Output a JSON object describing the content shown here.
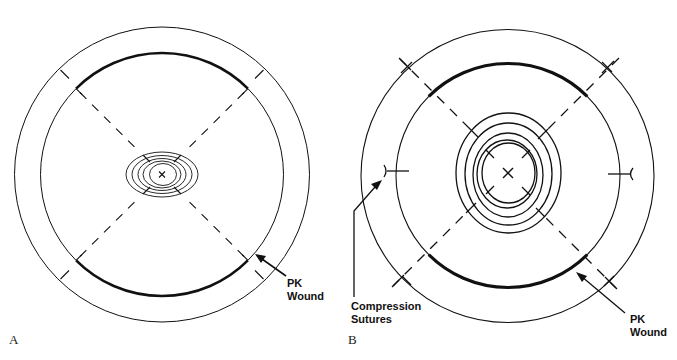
{
  "figure": {
    "panels": [
      {
        "id": "A",
        "letter": "A",
        "label_pk_line1": "PK",
        "label_pk_line2": "Wound"
      },
      {
        "id": "B",
        "letter": "B",
        "label_pk_line1": "PK",
        "label_pk_line2": "Wound",
        "label_sutures_line1": "Compression",
        "label_sutures_line2": "Sutures"
      }
    ],
    "colors": {
      "line": "#111111",
      "background": "#ffffff"
    }
  }
}
